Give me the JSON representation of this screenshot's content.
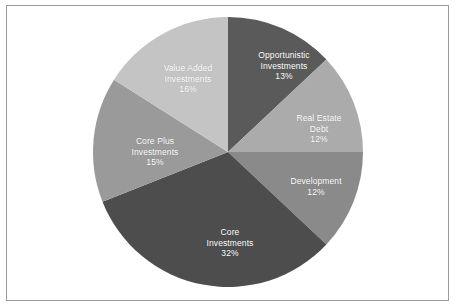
{
  "chart_data": {
    "type": "pie",
    "title": "",
    "subtitle": "",
    "xlabel": "",
    "ylabel": "",
    "legend_position": "none",
    "labels_inside_slices": true,
    "start_angle_deg": 0,
    "direction": "clockwise",
    "units": "percent",
    "total": 100,
    "categories": [
      "Opportunistic Investments",
      "Real Estate Debt",
      "Development",
      "Core Investments",
      "Core Plus Investments",
      "Value Added Investments"
    ],
    "values": [
      13,
      12,
      12,
      32,
      15,
      16
    ],
    "value_labels": [
      "13%",
      "12%",
      "12%",
      "32%",
      "15%",
      "16%"
    ],
    "colors": [
      "#5a5a5a",
      "#ababab",
      "#8a8a8a",
      "#4d4d4d",
      "#9a9a9a",
      "#c4c4c4"
    ],
    "slices": [
      {
        "name": "Opportunistic Investments",
        "name_line_1": "Opportunistic",
        "name_line_2": "Investments",
        "value": 13,
        "value_label": "13%",
        "color": "#5a5a5a",
        "label_x": 277,
        "label_y": 60
      },
      {
        "name": "Real Estate Debt",
        "name_line_1": "Real Estate",
        "name_line_2": "Debt",
        "value": 12,
        "value_label": "12%",
        "color": "#ababab",
        "label_x": 312,
        "label_y": 123
      },
      {
        "name": "Development",
        "name_line_1": "Development",
        "name_line_2": "",
        "value": 12,
        "value_label": "12%",
        "color": "#8a8a8a",
        "label_x": 309,
        "label_y": 180
      },
      {
        "name": "Core Investments",
        "name_line_1": "Core",
        "name_line_2": "Investments",
        "value": 32,
        "value_label": "32%",
        "color": "#4d4d4d",
        "label_x": 223,
        "label_y": 237
      },
      {
        "name": "Core Plus Investments",
        "name_line_1": "Core Plus",
        "name_line_2": "Investments",
        "value": 15,
        "value_label": "15%",
        "color": "#9a9a9a",
        "label_x": 148,
        "label_y": 146
      },
      {
        "name": "Value Added Investments",
        "name_line_1": "Value Added",
        "name_line_2": "Investments",
        "value": 16,
        "value_label": "16%",
        "color": "#c4c4c4",
        "label_x": 181,
        "label_y": 73
      }
    ],
    "geometry": {
      "center_x": 221,
      "center_y": 146,
      "radius": 135
    },
    "frame": {
      "border_color": "#9a9a9a",
      "background": "#ffffff"
    }
  }
}
